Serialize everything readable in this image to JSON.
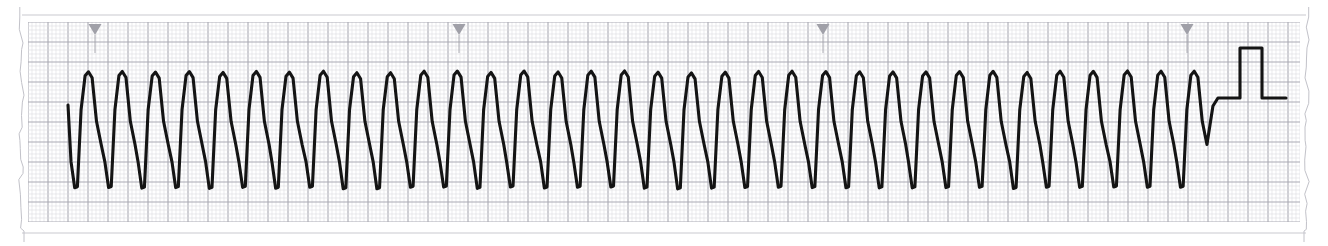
{
  "document": {
    "kind": "ecg-rhythm-strip",
    "width": 1328,
    "height": 246,
    "paper_color": "#ffffff",
    "edge_style": "torn-perforated"
  },
  "paper": {
    "left_edge_x": 24,
    "right_edge_x": 1304,
    "top_margin_line_y": 15,
    "bottom_margin_line_y": 233,
    "margin_line_color": "#c9c9cf"
  },
  "grid": {
    "x0": 28,
    "y0": 22,
    "x1": 1300,
    "y1": 222,
    "small_mm_px": 4,
    "large_mm_px": 20,
    "fine_color": "#dcdce1",
    "bold_color": "#a9a9b3",
    "fine_width": 0.6,
    "bold_width": 1.1
  },
  "tick_markers": {
    "color": "#a0a0a8",
    "shape": "triangle-down",
    "width": 13,
    "height": 11,
    "y": 24,
    "positions": [
      95,
      459,
      823,
      1187
    ],
    "interval_px": 364
  },
  "trace": {
    "color": "#141414",
    "stroke_width": 3.1,
    "lead_in": {
      "x": 68,
      "y": 105
    },
    "rhythm": {
      "type": "monomorphic-oscillation",
      "start_x": 68,
      "cycles": 34,
      "period_px": 33.5,
      "peak_y": 72,
      "trough_y": 188,
      "baseline_y": 130
    },
    "calibration_pulse": {
      "notch_y": 100,
      "baseline_y": 98,
      "flat_start_x": 1222,
      "rise_x": 1240,
      "top_y": 48,
      "fall_x": 1262,
      "end_x": 1286
    }
  },
  "chart_data": {
    "type": "line",
    "title": "",
    "xlabel": "",
    "ylabel": "",
    "grid": true,
    "legend": null,
    "paper_speed_mm_per_s": 25,
    "gain_mm_per_mV": 10,
    "series": [
      {
        "name": "rhythm-trace",
        "peak_count": 34,
        "period_px": 33.5,
        "amplitude_px": 116,
        "peak_y_px": 72,
        "trough_y_px": 188
      }
    ],
    "annotations": [
      {
        "name": "timing-tick",
        "x": 95
      },
      {
        "name": "timing-tick",
        "x": 459
      },
      {
        "name": "timing-tick",
        "x": 823
      },
      {
        "name": "timing-tick",
        "x": 1187
      },
      {
        "name": "calibration-pulse",
        "x": 1240,
        "height_px": 50
      }
    ]
  }
}
